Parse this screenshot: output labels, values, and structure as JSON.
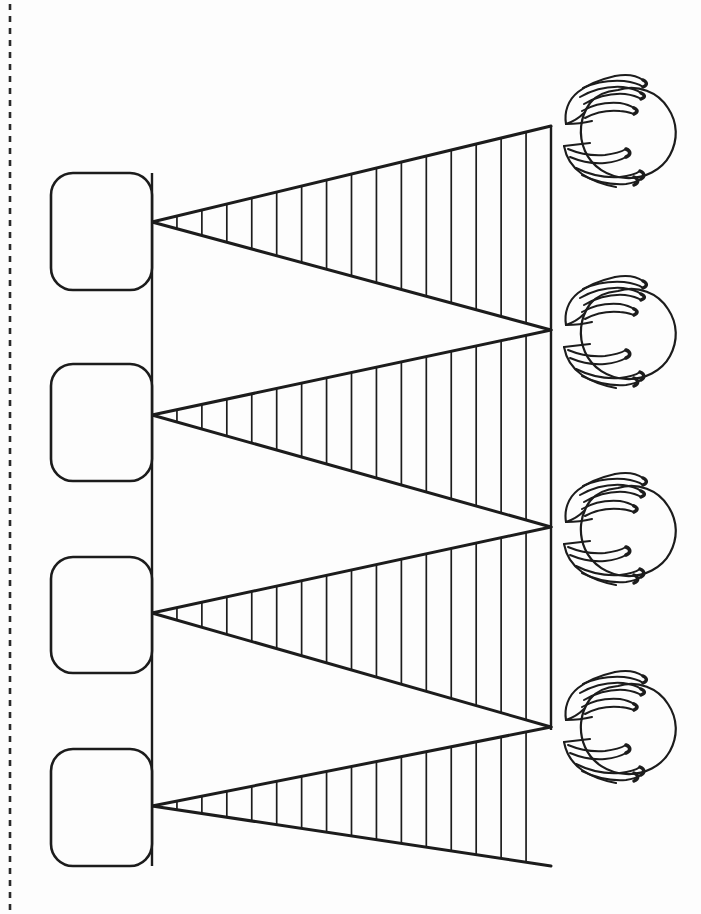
{
  "page": {
    "width": 701,
    "height": 914,
    "background_color": "#fdfdfd",
    "ink_color": "#1c1c1c"
  },
  "cut_line": {
    "name": "dashed-cut-line",
    "orientation": "vertical",
    "x": 10,
    "y_start": 4,
    "y_end": 910,
    "dash": "6 6",
    "stroke_width": 2.6,
    "color": "#2a2a2a"
  },
  "left_boxes": {
    "label": "answer-boxes",
    "count": 4,
    "text": "",
    "corner_radius": 22,
    "stroke_width": 2.6,
    "fill": "#fdfdfd",
    "items": [
      {
        "id": "box-1",
        "x": 51,
        "y": 173,
        "width": 101,
        "height": 117
      },
      {
        "id": "box-2",
        "x": 51,
        "y": 364,
        "width": 101,
        "height": 117
      },
      {
        "id": "box-3",
        "x": 51,
        "y": 557,
        "width": 101,
        "height": 116
      },
      {
        "id": "box-4",
        "x": 51,
        "y": 749,
        "width": 101,
        "height": 117
      }
    ]
  },
  "spine_lines": {
    "left_spine": {
      "x": 152,
      "y_start": 173,
      "y_end": 866,
      "stroke_width": 2.4
    },
    "right_spine": {
      "x": 551,
      "y_start": 126,
      "y_end": 730,
      "stroke_width": 2.4
    }
  },
  "bands": {
    "label": "converging-ruled-bands",
    "count": 4,
    "hatch_count": 15,
    "hatch_stroke_width": 1.7,
    "edge_stroke_width": 3.0,
    "left_x": 152,
    "right_x": 551,
    "items": [
      {
        "id": "band-1",
        "left_y": 222,
        "right_top_y": 126,
        "right_bottom_y": 330,
        "apex": "left"
      },
      {
        "id": "band-2",
        "left_y": 415,
        "right_top_y": 330,
        "right_bottom_y": 527,
        "apex": "left"
      },
      {
        "id": "band-3",
        "left_y": 613,
        "right_top_y": 527,
        "right_bottom_y": 727,
        "apex": "left"
      },
      {
        "id": "band-4",
        "left_y": 806,
        "right_top_y": 727,
        "right_bottom_y": 866,
        "apex": "left"
      }
    ],
    "note": "Each band is a long thin wedge: it meets the left spine at a single point and opens out to a tall segment on the right spine."
  },
  "right_figures": {
    "label": "hands-holding-ball",
    "count": 4,
    "icon_name": "hands-holding-ball-icon",
    "stroke_width": 2.2,
    "items": [
      {
        "id": "figure-1",
        "center_x": 612,
        "center_y": 130,
        "scale": 1.0
      },
      {
        "id": "figure-2",
        "center_x": 612,
        "center_y": 331,
        "scale": 1.0
      },
      {
        "id": "figure-3",
        "center_x": 612,
        "center_y": 528,
        "scale": 1.0
      },
      {
        "id": "figure-4",
        "center_x": 612,
        "center_y": 726,
        "scale": 1.0
      }
    ]
  },
  "colors": {
    "paper": "#fdfdfd",
    "ink": "#1c1c1c",
    "dash": "#2a2a2a"
  }
}
